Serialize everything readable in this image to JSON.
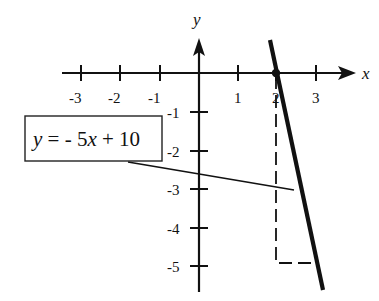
{
  "figure": {
    "x_axis_label": "x",
    "y_axis_label": "y",
    "x_ticks": [
      {
        "label": "-3",
        "value": -3
      },
      {
        "label": "-2",
        "value": -2
      },
      {
        "label": "-1",
        "value": -1
      },
      {
        "label": "1",
        "value": 1
      },
      {
        "label": "2",
        "value": 2
      },
      {
        "label": "3",
        "value": 3
      }
    ],
    "y_ticks": [
      {
        "label": "-1",
        "value": -1
      },
      {
        "label": "-2",
        "value": -2
      },
      {
        "label": "-3",
        "value": -3
      },
      {
        "label": "-4",
        "value": -4
      },
      {
        "label": "-5",
        "value": -5
      }
    ],
    "equation": {
      "y": "y",
      "eq_minus": " = - 5",
      "x": "x",
      "rest": " + 10"
    },
    "line": {
      "slope": -5,
      "intercept": 10,
      "x_intercept": 2
    },
    "slope_triangle": {
      "run": 1,
      "rise": -5,
      "from": [
        2,
        0
      ],
      "corner": [
        2,
        -5
      ],
      "to": [
        3,
        -5
      ]
    },
    "colors": {
      "ink": "#111111",
      "background": "#ffffff"
    }
  }
}
